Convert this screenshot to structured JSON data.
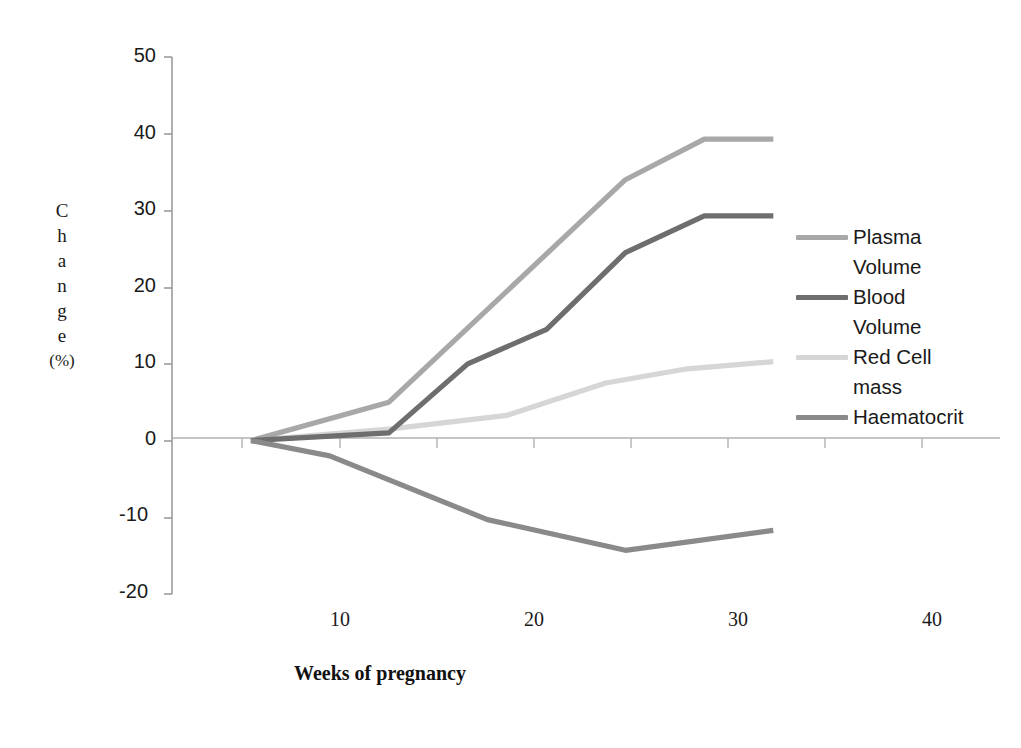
{
  "chart_data": {
    "type": "line",
    "title": "",
    "xlabel": "Weeks of pregnancy",
    "ylabel": "Change (%)",
    "ylabel_chars": [
      "C",
      "h",
      "a",
      "n",
      "g",
      "e",
      "(%)"
    ],
    "xlim": [
      0,
      42
    ],
    "ylim": [
      -20,
      50
    ],
    "x_ticks": [
      10,
      20,
      30,
      40
    ],
    "x_tick_labels": [
      "10",
      "20",
      "30",
      "40"
    ],
    "y_ticks": [
      -20,
      -10,
      0,
      10,
      20,
      30,
      40,
      50
    ],
    "y_tick_labels": [
      "-20",
      "-10",
      "0",
      "10",
      "20",
      "30",
      "40",
      "50"
    ],
    "grid": false,
    "legend_position": "right",
    "series": [
      {
        "name": "Plasma Volume",
        "color": "#a8a8a8",
        "x": [
          4,
          11,
          23,
          27,
          30.5
        ],
        "values": [
          0,
          5,
          34,
          39.3,
          39.3
        ]
      },
      {
        "name": "Blood Volume",
        "color": "#6e6e6e",
        "x": [
          4,
          11,
          15,
          19,
          23,
          27,
          30.5
        ],
        "values": [
          0,
          1,
          10,
          14.5,
          24.5,
          29.3,
          29.3
        ]
      },
      {
        "name": "Red Cell mass",
        "color": "#d6d6d6",
        "x": [
          4,
          11,
          17,
          22,
          26,
          30.5
        ],
        "values": [
          0,
          1.5,
          3.3,
          7.5,
          9.3,
          10.3
        ]
      },
      {
        "name": "Haematocrit",
        "color": "#8a8a8a",
        "x": [
          4,
          8,
          16,
          23,
          30.5
        ],
        "values": [
          0,
          -2,
          -10.3,
          -14.3,
          -11.7
        ]
      }
    ]
  },
  "axes": {
    "y_title_lines": [
      "C",
      "h",
      "a",
      "n",
      "g",
      "e",
      "(%)"
    ],
    "y_labels": [
      "50",
      "40",
      "30",
      "20",
      "10",
      "0",
      "-10",
      "-20"
    ],
    "x_labels": [
      "10",
      "20",
      "30",
      "40"
    ],
    "x_title": "Weeks of pregnancy",
    "axis_color": "#9b9b9b",
    "zero_line_color": "#b0b0b0"
  },
  "legend": {
    "entries": [
      {
        "label": "Plasma\nVolume",
        "color": "#a8a8a8"
      },
      {
        "label": "Blood\nVolume",
        "color": "#6e6e6e"
      },
      {
        "label": "Red Cell\nmass",
        "color": "#d6d6d6"
      },
      {
        "label": "Haematocrit",
        "color": "#8a8a8a"
      }
    ]
  }
}
